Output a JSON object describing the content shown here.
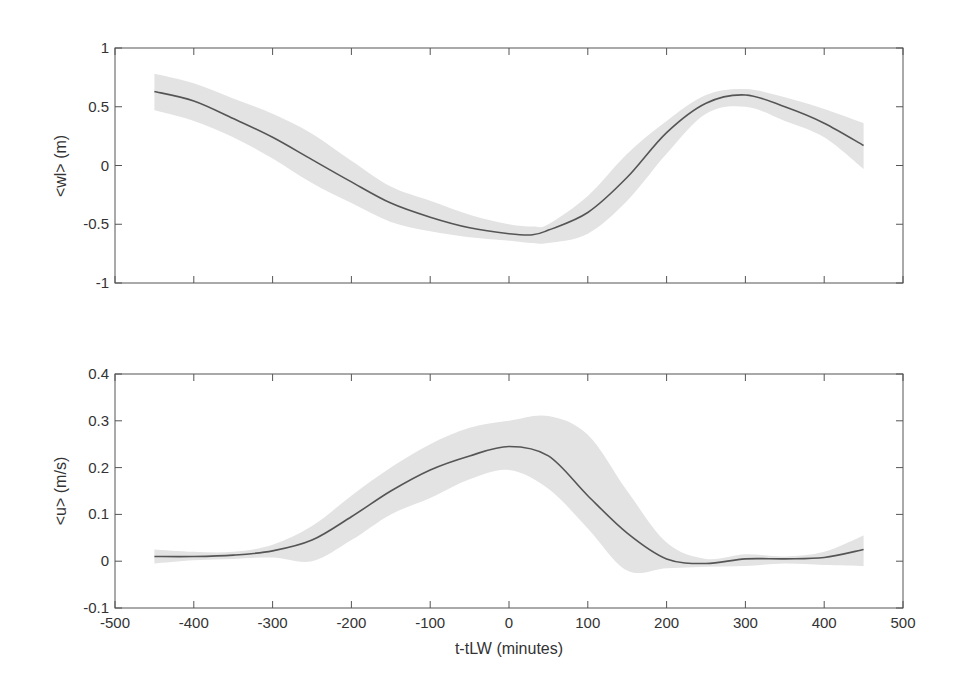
{
  "chart_data": [
    {
      "type": "line",
      "panel": "top",
      "title": "",
      "xlabel": "",
      "ylabel": "<wl> (m)",
      "xlim": [
        -500,
        500
      ],
      "ylim": [
        -1,
        1
      ],
      "xticks": [
        -500,
        -400,
        -300,
        -200,
        -100,
        0,
        100,
        200,
        300,
        400,
        500
      ],
      "xtick_labels_visible": false,
      "yticks": [
        -1,
        -0.5,
        0,
        0.5,
        1
      ],
      "ytick_labels": [
        "-1",
        "-0.5",
        "0",
        "0.5",
        "1"
      ],
      "grid": false,
      "legend": null,
      "x": [
        -450,
        -400,
        -350,
        -300,
        -250,
        -200,
        -150,
        -100,
        -50,
        0,
        30,
        50,
        100,
        150,
        200,
        250,
        300,
        350,
        400,
        450
      ],
      "series": [
        {
          "name": "mean",
          "style": "line",
          "color": "#555555",
          "values": [
            0.63,
            0.55,
            0.4,
            0.24,
            0.05,
            -0.14,
            -0.32,
            -0.44,
            -0.53,
            -0.58,
            -0.59,
            -0.55,
            -0.4,
            -0.1,
            0.28,
            0.53,
            0.6,
            0.5,
            0.36,
            0.17
          ]
        },
        {
          "name": "upper bound",
          "style": "shaded band",
          "color": "#e3e3e3",
          "values": [
            0.78,
            0.7,
            0.57,
            0.44,
            0.27,
            0.04,
            -0.18,
            -0.3,
            -0.42,
            -0.5,
            -0.52,
            -0.5,
            -0.26,
            0.1,
            0.38,
            0.6,
            0.65,
            0.58,
            0.48,
            0.36
          ]
        },
        {
          "name": "lower bound",
          "style": "shaded band",
          "color": "#e3e3e3",
          "values": [
            0.47,
            0.38,
            0.24,
            0.06,
            -0.15,
            -0.32,
            -0.48,
            -0.56,
            -0.61,
            -0.64,
            -0.66,
            -0.66,
            -0.58,
            -0.3,
            0.1,
            0.44,
            0.5,
            0.38,
            0.24,
            -0.03
          ]
        }
      ]
    },
    {
      "type": "line",
      "panel": "bottom",
      "title": "",
      "xlabel": "t-tLW (minutes)",
      "ylabel": "<u> (m/s)",
      "xlim": [
        -500,
        500
      ],
      "ylim": [
        -0.1,
        0.4
      ],
      "xticks": [
        -500,
        -400,
        -300,
        -200,
        -100,
        0,
        100,
        200,
        300,
        400,
        500
      ],
      "xtick_labels": [
        "-500",
        "-400",
        "-300",
        "-200",
        "-100",
        "0",
        "100",
        "200",
        "300",
        "400",
        "500"
      ],
      "yticks": [
        -0.1,
        0,
        0.1,
        0.2,
        0.3,
        0.4
      ],
      "ytick_labels": [
        "-0.1",
        "0",
        "0.1",
        "0.2",
        "0.3",
        "0.4"
      ],
      "grid": false,
      "legend": null,
      "x": [
        -450,
        -400,
        -350,
        -300,
        -250,
        -200,
        -150,
        -100,
        -50,
        0,
        50,
        100,
        150,
        200,
        250,
        300,
        350,
        400,
        450
      ],
      "series": [
        {
          "name": "mean",
          "style": "line",
          "color": "#555555",
          "values": [
            0.01,
            0.01,
            0.013,
            0.022,
            0.045,
            0.095,
            0.15,
            0.195,
            0.225,
            0.245,
            0.225,
            0.14,
            0.06,
            0.005,
            -0.005,
            0.005,
            0.005,
            0.008,
            0.025
          ]
        },
        {
          "name": "upper bound",
          "style": "shaded band",
          "color": "#e3e3e3",
          "values": [
            0.025,
            0.02,
            0.02,
            0.035,
            0.075,
            0.14,
            0.2,
            0.25,
            0.285,
            0.3,
            0.31,
            0.27,
            0.15,
            0.04,
            0.005,
            0.015,
            0.01,
            0.02,
            0.055
          ]
        },
        {
          "name": "lower bound",
          "style": "shaded band",
          "color": "#e3e3e3",
          "values": [
            -0.005,
            0.002,
            0.005,
            0.008,
            0.0,
            0.045,
            0.1,
            0.135,
            0.175,
            0.195,
            0.155,
            0.07,
            -0.02,
            -0.015,
            -0.012,
            -0.01,
            -0.005,
            -0.008,
            -0.01
          ]
        }
      ]
    }
  ],
  "labels": {
    "top_ylabel": "<wl> (m)",
    "bottom_ylabel": "<u> (m/s)",
    "xlabel": "t-tLW (minutes)"
  },
  "colors": {
    "band": "#e3e3e3",
    "line": "#555555",
    "axis": "#555555",
    "text": "#333333"
  }
}
